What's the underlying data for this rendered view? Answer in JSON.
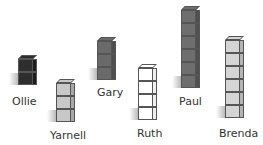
{
  "people": [
    {
      "name": "Ollie",
      "cubes": 2,
      "color": "#2e2e2e",
      "side": "#1c1c1c",
      "x": 18,
      "base": 85,
      "label_x": 12,
      "label_y": 95
    },
    {
      "name": "Yarnell",
      "cubes": 3,
      "color": "#c8c8c8",
      "side": "#a8a8a8",
      "x": 56,
      "base": 122,
      "label_x": 50,
      "label_y": 129
    },
    {
      "name": "Gary",
      "cubes": 3,
      "color": "#6a6a6a",
      "side": "#4e4e4e",
      "x": 97,
      "base": 80,
      "label_x": 97,
      "label_y": 86
    },
    {
      "name": "Ruth",
      "cubes": 4,
      "color": "#ffffff",
      "side": "#eeeeee",
      "x": 138,
      "base": 120,
      "label_x": 137,
      "label_y": 127
    },
    {
      "name": "Paul",
      "cubes": 6,
      "color": "#6e6e6e",
      "side": "#505050",
      "x": 181,
      "base": 88,
      "label_x": 179,
      "label_y": 95
    },
    {
      "name": "Brenda",
      "cubes": 6,
      "color": "#d4d4d4",
      "side": "#b4b4b4",
      "x": 225,
      "base": 118,
      "label_x": 219,
      "label_y": 127
    }
  ]
}
